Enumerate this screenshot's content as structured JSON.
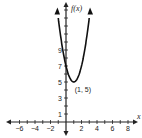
{
  "chart_data": {
    "type": "line",
    "title": "",
    "xlabel": "x",
    "ylabel": "f(x)",
    "function": "f(x) = 2(x - 1)^2 + 5",
    "vertex": {
      "x": 1,
      "y": 5,
      "label": "(1, 5)"
    },
    "x_ticks": [
      -6,
      -4,
      -2,
      2,
      4,
      6,
      8
    ],
    "y_ticks": [
      1,
      3,
      5,
      7,
      9
    ],
    "xlim": [
      -7,
      9
    ],
    "ylim": [
      -1,
      14
    ],
    "grid": false,
    "series": [
      {
        "name": "f(x)",
        "x": [
          -1.1,
          0,
          1,
          2,
          3.1
        ],
        "values": [
          13.8,
          7,
          5,
          7,
          13.8
        ]
      }
    ]
  },
  "labels": {
    "x_axis": "x",
    "y_axis": "f(x)",
    "vertex": "(1, 5)"
  }
}
